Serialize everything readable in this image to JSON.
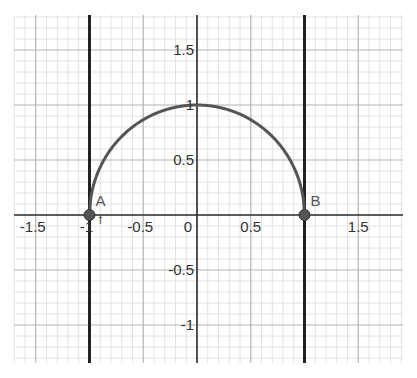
{
  "chart_data": {
    "type": "line",
    "title": "",
    "xlabel": "",
    "ylabel": "",
    "xlim": [
      -1.7,
      1.92
    ],
    "ylim": [
      -1.35,
      1.82
    ],
    "grid": {
      "major": 0.5,
      "minor": 0.1,
      "visible": true
    },
    "x_ticks": [
      {
        "value": -1.5,
        "label": "-1.5"
      },
      {
        "value": -1,
        "label": "-1"
      },
      {
        "value": -0.5,
        "label": "-0.5"
      },
      {
        "value": 0,
        "label": "0"
      },
      {
        "value": 0.5,
        "label": "0.5"
      },
      {
        "value": 1.5,
        "label": "1.5"
      }
    ],
    "y_ticks": [
      {
        "value": 1.5,
        "label": "1.5"
      },
      {
        "value": 1,
        "label": "1"
      },
      {
        "value": 0.5,
        "label": "0.5"
      },
      {
        "value": -0.5,
        "label": "-0.5"
      },
      {
        "value": -1,
        "label": "-1"
      }
    ],
    "series": [
      {
        "name": "f",
        "description": "upper unit semicircle y = sqrt(1 - x^2)",
        "x": [
          -1,
          -0.9,
          -0.8,
          -0.6,
          -0.4,
          -0.2,
          0,
          0.2,
          0.4,
          0.6,
          0.8,
          0.9,
          1
        ],
        "y": [
          0,
          0.436,
          0.6,
          0.8,
          0.917,
          0.98,
          1,
          0.98,
          0.917,
          0.8,
          0.6,
          0.436,
          0
        ],
        "color": "#555555"
      }
    ],
    "vertical_lines": [
      {
        "x": -1,
        "color": "#222222"
      },
      {
        "x": 1,
        "color": "#222222"
      }
    ],
    "points": [
      {
        "label": "A",
        "x": -1,
        "y": 0,
        "color": "#555555"
      },
      {
        "label": "B",
        "x": 1,
        "y": 0,
        "color": "#555555"
      }
    ],
    "function_label": {
      "text": "f",
      "x": -0.96,
      "y": -0.01
    }
  },
  "colors": {
    "background": "#ffffff",
    "minor_grid": "#e2e2e2",
    "major_grid": "#b4b4b4",
    "axis": "#333333",
    "curve": "#555555",
    "vertical_lines": "#222222",
    "point_fill": "#555555"
  }
}
